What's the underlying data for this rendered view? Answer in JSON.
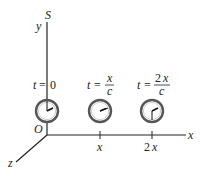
{
  "diagram": {
    "frame_label": "S",
    "axes": {
      "x_label": "x",
      "y_label": "y",
      "z_label": "z",
      "origin_label": "O"
    },
    "ticks": [
      {
        "label": "x"
      },
      {
        "label": "2x",
        "coef": "2",
        "var": "x"
      }
    ],
    "clocks": [
      {
        "name": "clock-origin",
        "time_label": {
          "t": "t",
          "eq": "=",
          "value": "0"
        }
      },
      {
        "name": "clock-x",
        "time_label": {
          "t": "t",
          "eq": "=",
          "numerator": "x",
          "denominator": "c"
        }
      },
      {
        "name": "clock-2x",
        "time_label": {
          "t": "t",
          "eq": "=",
          "numerator_coef": "2",
          "numerator_var": "x",
          "denominator": "c"
        }
      }
    ],
    "colors": {
      "axis": "#222222",
      "clock_rim": "#555555",
      "clock_face": "#ffffff",
      "hand": "#111111"
    }
  }
}
